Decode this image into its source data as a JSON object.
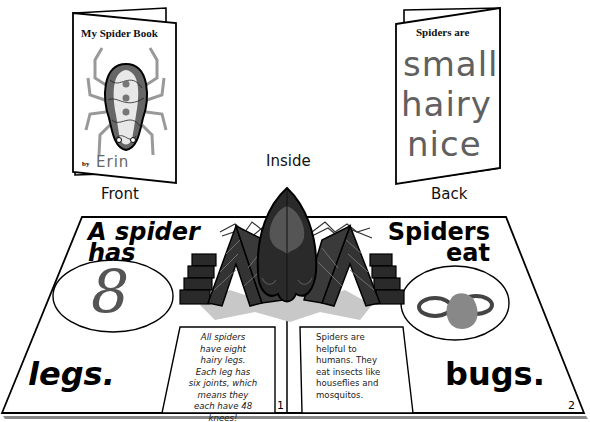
{
  "front_book": {
    "title": "My Spider Book",
    "by_label": "by",
    "author": "Erin",
    "caption": "Front",
    "illustration": "spider-drawing-icon"
  },
  "back_book": {
    "title": "Spiders are",
    "handwritten_lines": [
      "small",
      "hairy",
      "nice"
    ],
    "caption": "Back"
  },
  "inside": {
    "caption": "Inside",
    "popup": "pop-up-spider-icon",
    "left_page": {
      "heading_line1": "A spider",
      "heading_line2": "has",
      "number": "8",
      "footer_word": "legs.",
      "fact_lines": [
        "All spiders",
        "have eight",
        "hairy legs.",
        "Each leg has",
        "six joints, which",
        "means they",
        "each have 48",
        "knees!"
      ],
      "page_number": "1"
    },
    "right_page": {
      "heading_line1": "Spiders",
      "heading_line2": "eat",
      "illustration": "fly-bug-icon",
      "footer_word": "bugs.",
      "fact_lines": [
        "Spiders are",
        "helpful to",
        "humans. They",
        "eat insects like",
        "houseflies and",
        "mosquitos."
      ],
      "page_number": "2"
    }
  },
  "colors": {
    "ink": "#000000",
    "gray_ink": "#777777",
    "spider_dark": "#2a2a2a",
    "spider_mid": "#555555",
    "shadow": "#c8c8c8"
  }
}
